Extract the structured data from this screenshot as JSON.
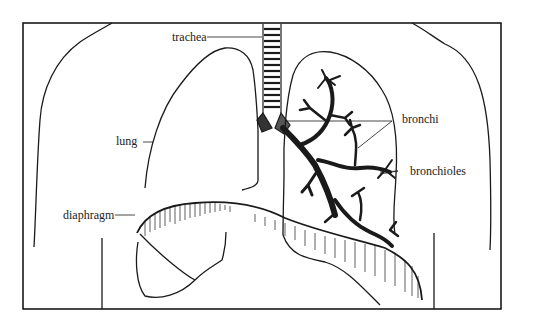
{
  "diagram": {
    "labels": {
      "trachea": "trachea",
      "lung": "lung",
      "bronchi": "bronchi",
      "bronchioles": "bronchioles",
      "diaphragm": "diaphragm"
    },
    "colors": {
      "line": "#1a1a1a",
      "background": "#ffffff"
    }
  }
}
